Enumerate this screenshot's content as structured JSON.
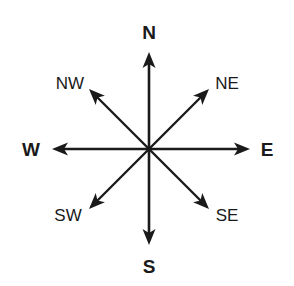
{
  "diagram": {
    "type": "compass-rose",
    "center": [
      149,
      149
    ],
    "stroke_color": "#1a1a1a",
    "cardinal": [
      {
        "key": "north",
        "label": "N",
        "tip": [
          149,
          52
        ],
        "label_pos": [
          149,
          32
        ]
      },
      {
        "key": "east",
        "label": "E",
        "tip": [
          250,
          149
        ],
        "label_pos": [
          267,
          149
        ]
      },
      {
        "key": "south",
        "label": "S",
        "tip": [
          149,
          245
        ],
        "label_pos": [
          149,
          266
        ]
      },
      {
        "key": "west",
        "label": "W",
        "tip": [
          52,
          149
        ],
        "label_pos": [
          31,
          149
        ]
      }
    ],
    "intercardinal": [
      {
        "key": "northeast",
        "label": "NE",
        "tip": [
          209,
          89
        ],
        "label_pos": [
          227,
          83
        ]
      },
      {
        "key": "southeast",
        "label": "SE",
        "tip": [
          209,
          209
        ],
        "label_pos": [
          227,
          215
        ]
      },
      {
        "key": "southwest",
        "label": "SW",
        "tip": [
          89,
          209
        ],
        "label_pos": [
          68,
          215
        ]
      },
      {
        "key": "northwest",
        "label": "NW",
        "tip": [
          89,
          89
        ],
        "label_pos": [
          70,
          83
        ]
      }
    ]
  }
}
